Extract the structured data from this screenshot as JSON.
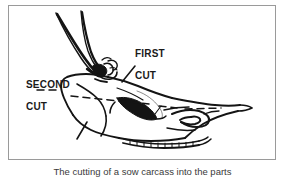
{
  "figure": {
    "caption": "The cutting of a sow carcass into the parts",
    "frame": {
      "border_color": "#9a9a9a",
      "background_color": "#ffffff"
    },
    "ink_color": "#141414",
    "labels": [
      {
        "id": "first-cut",
        "text": "FIRST\nCUT",
        "line1": "FIRST",
        "line2": "CUT"
      },
      {
        "id": "second-cut",
        "text": "SECOND\nCUT",
        "line1": "SECOND",
        "line2": "CUT"
      }
    ],
    "annotations": {
      "dashed_guide_lines": 4,
      "cut_marker_ticks": 3
    }
  },
  "diagram_data": {
    "type": "line-drawing",
    "subject": "animal head and foreleg profile with butchering cut guides",
    "elements": [
      "foreleg / shank with joint knuckle at upper left",
      "head profile outline running left to right",
      "shaded ear or eye mass at center",
      "nostril / muzzle scroll at right",
      "row of teeth along lower jaw",
      "dashed horizontal guide line through skull",
      "dashed short cut markers at first and second cut"
    ]
  }
}
